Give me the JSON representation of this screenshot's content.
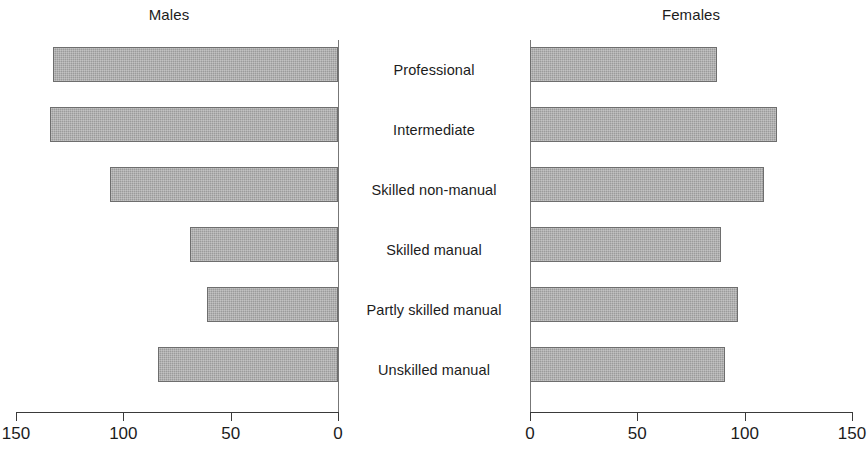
{
  "chart_data": {
    "type": "bar",
    "title": "",
    "orientation": "horizontal",
    "style": "population-pyramid / back-to-back bar chart",
    "categories": [
      "Professional",
      "Intermediate",
      "Skilled non-manual",
      "Skilled manual",
      "Partly skilled manual",
      "Unskilled manual"
    ],
    "series": [
      {
        "name": "Males",
        "values": [
          133,
          134,
          106,
          69,
          61,
          84
        ]
      },
      {
        "name": "Females",
        "values": [
          87,
          115,
          109,
          89,
          97,
          91
        ]
      }
    ],
    "panels": [
      {
        "name": "Males",
        "title": "Males",
        "axis_direction": "right-to-left",
        "xlim": [
          0,
          150
        ],
        "ticks": [
          150,
          100,
          50,
          0
        ],
        "ticklabels": [
          "150",
          "100",
          "50",
          "0"
        ]
      },
      {
        "name": "Females",
        "title": "Females",
        "axis_direction": "left-to-right",
        "xlim": [
          0,
          150
        ],
        "ticks": [
          0,
          50,
          100,
          150
        ],
        "ticklabels": [
          "0",
          "50",
          "100",
          "150"
        ]
      }
    ],
    "xlabel": "",
    "ylabel": "",
    "grid": false,
    "legend": false,
    "colors": {
      "bar_fill": "#9b9b9b",
      "bar_border": "#6e6e6e",
      "axis": "#3a3a3a",
      "text": "#1c1c1c",
      "background": "#ffffff"
    }
  }
}
